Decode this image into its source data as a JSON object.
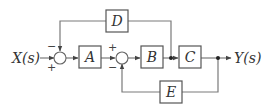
{
  "diagram": {
    "input_label": "X(s)",
    "output_label": "Y(s)",
    "blocks": [
      {
        "id": "A",
        "label": "A"
      },
      {
        "id": "B",
        "label": "B"
      },
      {
        "id": "C",
        "label": "C"
      },
      {
        "id": "D",
        "label": "D"
      },
      {
        "id": "E",
        "label": "E"
      }
    ],
    "summing_junctions": [
      {
        "id": "S1",
        "signs": {
          "input": "+",
          "feedback": "−"
        }
      },
      {
        "id": "S2",
        "signs": {
          "input": "+",
          "feedback": "−"
        }
      }
    ],
    "connections": [
      {
        "from": "X(s)",
        "to": "S1",
        "sign": "+"
      },
      {
        "from": "S1",
        "to": "A"
      },
      {
        "from": "A",
        "to": "S2",
        "sign": "+"
      },
      {
        "from": "S2",
        "to": "B"
      },
      {
        "from": "B",
        "to": "C"
      },
      {
        "from": "B-output",
        "to": "D"
      },
      {
        "from": "D",
        "to": "S1",
        "sign": "−"
      },
      {
        "from": "C",
        "to": "Y(s)"
      },
      {
        "from": "C-output",
        "to": "E"
      },
      {
        "from": "E",
        "to": "S2",
        "sign": "−"
      }
    ]
  }
}
